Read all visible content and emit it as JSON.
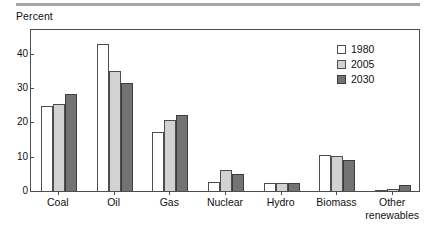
{
  "chart_data": {
    "type": "bar",
    "title": "",
    "subtitle": "",
    "xlabel": "",
    "ylabel": "Percent",
    "ylim": [
      0,
      47
    ],
    "yticks": [
      0,
      10,
      20,
      30,
      40
    ],
    "ytick_labels": [
      "0",
      "10",
      "20",
      "30",
      "40"
    ],
    "grid": false,
    "legend_position": "top-right",
    "categories": [
      "Coal",
      "Oil",
      "Gas",
      "Nuclear",
      "Hydro",
      "Biomass",
      "Other\nrenewables"
    ],
    "series": [
      {
        "name": "1980",
        "color": "#ffffff",
        "values": [
          24.8,
          43.0,
          17.2,
          2.6,
          2.2,
          10.4,
          0.2
        ]
      },
      {
        "name": "2005",
        "color": "#d2d2d2",
        "values": [
          25.3,
          35.1,
          20.6,
          6.2,
          2.3,
          10.1,
          0.6
        ]
      },
      {
        "name": "2030",
        "color": "#737373",
        "values": [
          28.3,
          31.6,
          22.3,
          4.9,
          2.3,
          9.1,
          1.8
        ]
      }
    ]
  },
  "colors": {
    "series_1980": "#ffffff",
    "series_2005": "#d2d2d2",
    "series_2030": "#737373",
    "axis": "#4d4d4d",
    "rule": "#a6a6a6",
    "text": "#111111"
  }
}
